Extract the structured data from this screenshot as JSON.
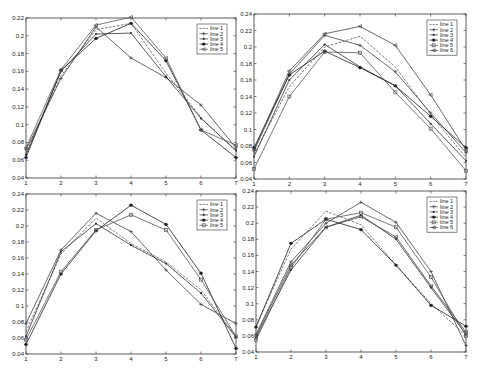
{
  "chart_data": [
    {
      "id": "top-left",
      "type": "line",
      "title": "",
      "xlabel": "",
      "ylabel": "",
      "x": [
        1,
        2,
        3,
        4,
        5,
        6,
        7
      ],
      "xlim": [
        1,
        7
      ],
      "ylim": [
        0.04,
        0.22
      ],
      "yticks": [
        0.04,
        0.06,
        0.08,
        0.1,
        0.12,
        0.14,
        0.16,
        0.18,
        0.2,
        0.22
      ],
      "ytick_labels": [
        "0.04",
        "0.06",
        "0.08",
        "0.1",
        "0.12",
        "0.14",
        "0.16",
        "0.18",
        "0.2",
        "0.22"
      ],
      "xtick_labels": [
        "1",
        "2",
        "3",
        "4",
        "5",
        "6",
        "7"
      ],
      "grid": false,
      "legend_position": "upper right",
      "series": [
        {
          "name": "line 1",
          "style": "dashed",
          "marker": "none",
          "values": [
            0.068,
            0.155,
            0.207,
            0.214,
            0.158,
            0.108,
            0.07
          ]
        },
        {
          "name": "line 2",
          "style": "solid",
          "marker": "plus",
          "values": [
            0.072,
            0.152,
            0.21,
            0.175,
            0.153,
            0.122,
            0.074
          ]
        },
        {
          "name": "line 3",
          "style": "solid",
          "marker": "dot",
          "values": [
            0.066,
            0.16,
            0.202,
            0.203,
            0.154,
            0.107,
            0.071
          ]
        },
        {
          "name": "line 4",
          "style": "solid",
          "marker": "star",
          "values": [
            0.063,
            0.161,
            0.197,
            0.214,
            0.172,
            0.094,
            0.063
          ]
        },
        {
          "name": "line 5",
          "style": "solid",
          "marker": "triangle",
          "values": [
            0.074,
            0.162,
            0.212,
            0.221,
            0.175,
            0.094,
            0.077
          ]
        }
      ]
    },
    {
      "id": "top-right",
      "type": "line",
      "title": "",
      "xlabel": "",
      "ylabel": "",
      "x": [
        1,
        2,
        3,
        4,
        5,
        6,
        7
      ],
      "xlim": [
        1,
        7
      ],
      "ylim": [
        0.04,
        0.24
      ],
      "yticks": [
        0.04,
        0.06,
        0.08,
        0.1,
        0.12,
        0.14,
        0.16,
        0.18,
        0.2,
        0.22,
        0.24
      ],
      "ytick_labels": [
        "0.04",
        "0.06",
        "0.08",
        "0.1",
        "0.12",
        "0.14",
        "0.16",
        "0.18",
        "0.2",
        "0.22",
        "0.24"
      ],
      "xtick_labels": [
        "1",
        "2",
        "3",
        "4",
        "5",
        "6",
        "7"
      ],
      "grid": false,
      "legend_position": "upper right",
      "series": [
        {
          "name": "line 1",
          "style": "dashed",
          "marker": "none",
          "values": [
            0.07,
            0.152,
            0.2,
            0.213,
            0.176,
            0.118,
            0.066
          ]
        },
        {
          "name": "line 2",
          "style": "solid",
          "marker": "plus",
          "values": [
            0.074,
            0.167,
            0.214,
            0.202,
            0.17,
            0.12,
            0.072
          ]
        },
        {
          "name": "line 3",
          "style": "solid",
          "marker": "dot",
          "values": [
            0.067,
            0.16,
            0.203,
            0.176,
            0.153,
            0.107,
            0.062
          ]
        },
        {
          "name": "line 4",
          "style": "solid",
          "marker": "star",
          "values": [
            0.078,
            0.166,
            0.195,
            0.175,
            0.153,
            0.116,
            0.078
          ]
        },
        {
          "name": "line 5",
          "style": "solid",
          "marker": "square",
          "values": [
            0.052,
            0.14,
            0.194,
            0.193,
            0.145,
            0.101,
            0.05
          ]
        },
        {
          "name": "line 6",
          "style": "solid",
          "marker": "triangle",
          "values": [
            0.076,
            0.171,
            0.216,
            0.225,
            0.202,
            0.142,
            0.075
          ]
        }
      ]
    },
    {
      "id": "bottom-left",
      "type": "line",
      "title": "",
      "xlabel": "",
      "ylabel": "",
      "x": [
        1,
        2,
        3,
        4,
        5,
        6,
        7
      ],
      "xlim": [
        1,
        7
      ],
      "ylim": [
        0.04,
        0.24
      ],
      "yticks": [
        0.04,
        0.06,
        0.08,
        0.1,
        0.12,
        0.14,
        0.16,
        0.18,
        0.2,
        0.22,
        0.24
      ],
      "ytick_labels": [
        "0.04",
        "0.06",
        "0.08",
        "0.1",
        "0.12",
        "0.14",
        "0.16",
        "0.18",
        "0.2",
        "0.22",
        "0.24"
      ],
      "xtick_labels": [
        "1",
        "2",
        "3",
        "4",
        "5",
        "6",
        "7"
      ],
      "grid": false,
      "legend_position": "upper right",
      "series": [
        {
          "name": "line 1",
          "style": "dashed",
          "marker": "none",
          "values": [
            0.068,
            0.165,
            0.21,
            0.178,
            0.155,
            0.12,
            0.062
          ]
        },
        {
          "name": "line 2",
          "style": "solid",
          "marker": "plus",
          "values": [
            0.078,
            0.17,
            0.216,
            0.193,
            0.145,
            0.102,
            0.078
          ]
        },
        {
          "name": "line 3",
          "style": "solid",
          "marker": "dot",
          "values": [
            0.062,
            0.168,
            0.203,
            0.176,
            0.153,
            0.116,
            0.061
          ]
        },
        {
          "name": "line 4",
          "style": "solid",
          "marker": "star",
          "values": [
            0.052,
            0.14,
            0.194,
            0.226,
            0.202,
            0.141,
            0.047
          ]
        },
        {
          "name": "line 5",
          "style": "solid",
          "marker": "square",
          "values": [
            0.058,
            0.143,
            0.195,
            0.214,
            0.195,
            0.133,
            0.062
          ]
        }
      ]
    },
    {
      "id": "bottom-right",
      "type": "line",
      "title": "",
      "xlabel": "",
      "ylabel": "",
      "x": [
        1,
        2,
        3,
        4,
        5,
        6,
        7
      ],
      "xlim": [
        1,
        7
      ],
      "ylim": [
        0.04,
        0.24
      ],
      "yticks": [
        0.04,
        0.06,
        0.08,
        0.1,
        0.12,
        0.14,
        0.16,
        0.18,
        0.2,
        0.22,
        0.24
      ],
      "ytick_labels": [
        "0.04",
        "0.06",
        "0.08",
        "0.1",
        "0.12",
        "0.14",
        "0.16",
        "0.18",
        "0.2",
        "0.22",
        "0.24"
      ],
      "xtick_labels": [
        "1",
        "2",
        "3",
        "4",
        "5",
        "6",
        "7"
      ],
      "grid": false,
      "legend_position": "upper right",
      "series": [
        {
          "name": "line 1",
          "style": "dashed",
          "marker": "none",
          "values": [
            0.072,
            0.168,
            0.215,
            0.198,
            0.148,
            0.1,
            0.06
          ]
        },
        {
          "name": "line 2",
          "style": "solid",
          "marker": "plus",
          "values": [
            0.062,
            0.152,
            0.2,
            0.226,
            0.201,
            0.14,
            0.048
          ]
        },
        {
          "name": "line 3",
          "style": "solid",
          "marker": "dot",
          "values": [
            0.058,
            0.142,
            0.195,
            0.21,
            0.18,
            0.12,
            0.062
          ]
        },
        {
          "name": "line 4",
          "style": "solid",
          "marker": "star",
          "values": [
            0.071,
            0.175,
            0.205,
            0.192,
            0.148,
            0.098,
            0.072
          ]
        },
        {
          "name": "line 5",
          "style": "solid",
          "marker": "square",
          "values": [
            0.055,
            0.145,
            0.205,
            0.213,
            0.195,
            0.133,
            0.06
          ]
        },
        {
          "name": "line 6",
          "style": "solid",
          "marker": "triangle",
          "values": [
            0.06,
            0.148,
            0.195,
            0.208,
            0.183,
            0.122,
            0.065
          ]
        }
      ]
    }
  ],
  "layout": {
    "panels": {
      "top-left": {
        "left": 26,
        "top": 18,
        "width": 210,
        "height": 160
      },
      "top-right": {
        "left": 254,
        "top": 14,
        "width": 212,
        "height": 165
      },
      "bottom-left": {
        "left": 26,
        "top": 194,
        "width": 210,
        "height": 160
      },
      "bottom-right": {
        "left": 256,
        "top": 191,
        "width": 210,
        "height": 161
      }
    },
    "series_colors": [
      "#555555",
      "#444444",
      "#333333",
      "#222222",
      "#555555",
      "#444444"
    ]
  }
}
